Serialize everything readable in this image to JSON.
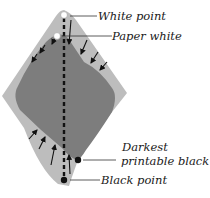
{
  "diagram": {
    "type": "gamut-compression",
    "colors": {
      "gamut_outer": "#b9b9b9",
      "gamut_inner": "#7f7f7f",
      "axis": "#111111",
      "arrows": "#111111",
      "text": "#1a1a1a"
    },
    "labels": {
      "white_point": "White point",
      "paper_white": "Paper white",
      "darkest_black_line1": "Darkest",
      "darkest_black_line2": "printable black",
      "black_point": "Black point"
    },
    "markers": [
      {
        "name": "white-point-marker",
        "style": "open-circle"
      },
      {
        "name": "paper-white-marker",
        "style": "open-circle"
      },
      {
        "name": "darkest-printable-black-marker",
        "style": "filled-dot"
      },
      {
        "name": "black-point-marker",
        "style": "filled-dot"
      }
    ],
    "arrows": {
      "upper_count": 7,
      "lower_count": 4
    }
  }
}
